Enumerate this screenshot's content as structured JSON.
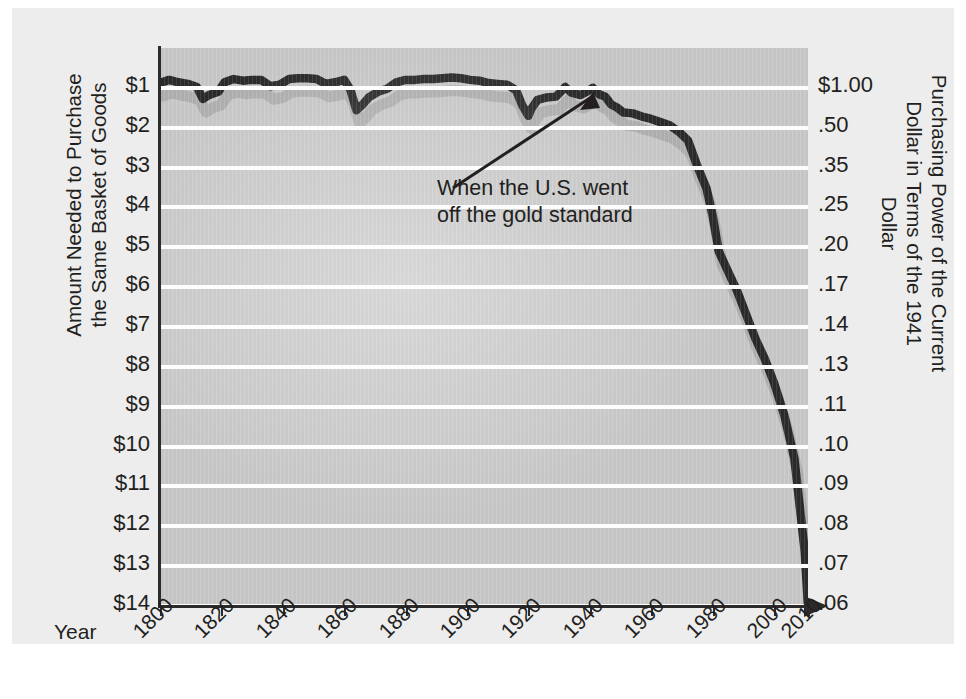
{
  "figure": {
    "background_color": "#ffffff",
    "panel_color": "#ededed",
    "plot_color": "#c9c9c9",
    "gridline_color": "#fdfdfd",
    "line_color": "#2b2b2b",
    "axis_color": "#2b2b2b"
  },
  "axes": {
    "x_axis_name": "Year",
    "left_title_line1": "Amount Needed to Purchase",
    "left_title_line2": "the Same Basket of Goods",
    "right_title_line1": "Purchasing Power of the Current",
    "right_title_line2": "Dollar in Terms of the 1941 Dollar"
  },
  "annotation": {
    "line1": "When the U.S. went",
    "line2": "off the gold standard",
    "target_year": 1941
  },
  "chart_data": {
    "type": "line",
    "title": "",
    "subtitle": "",
    "xlabel": "Year",
    "ylabel": "Amount Needed to Purchase the Same Basket of Goods",
    "ylabel_right": "Purchasing Power of the Current Dollar in Terms of the 1941 Dollar",
    "grid": true,
    "legend": "none",
    "xlim": [
      1800,
      2010
    ],
    "x_tick_labels": [
      "1800",
      "1820",
      "1840",
      "1860",
      "1880",
      "1900",
      "1920",
      "1940",
      "1960",
      "1980",
      "2000",
      "2010"
    ],
    "x_tick_values": [
      1800,
      1820,
      1840,
      1860,
      1880,
      1900,
      1920,
      1940,
      1960,
      1980,
      2000,
      2010
    ],
    "y_left_tick_labels": [
      "$1",
      "$2",
      "$3",
      "$4",
      "$5",
      "$6",
      "$7",
      "$8",
      "$9",
      "$10",
      "$11",
      "$12",
      "$13",
      "$14"
    ],
    "y_left_tick_values": [
      1,
      2,
      3,
      4,
      5,
      6,
      7,
      8,
      9,
      10,
      11,
      12,
      13,
      14
    ],
    "y_right_tick_labels": [
      "$1.00",
      ".50",
      ".35",
      ".25",
      ".20",
      ".17",
      ".14",
      ".13",
      ".11",
      ".10",
      ".09",
      ".08",
      ".07",
      ".06"
    ],
    "y_right_tick_values": [
      1.0,
      0.5,
      0.35,
      0.25,
      0.2,
      0.17,
      0.14,
      0.13,
      0.11,
      0.1,
      0.09,
      0.08,
      0.07,
      0.06
    ],
    "y_axis_note": "Left scale is dollars needed (1 to 14), inverted so larger dollars are lower. Right scale is the reciprocal purchasing power.",
    "series": [
      {
        "name": "Dollars needed to purchase the same basket of goods",
        "units": "dollars",
        "x": [
          1800,
          1803,
          1806,
          1809,
          1812,
          1814,
          1816,
          1819,
          1821,
          1824,
          1827,
          1830,
          1833,
          1836,
          1839,
          1842,
          1845,
          1848,
          1851,
          1854,
          1857,
          1860,
          1862,
          1864,
          1866,
          1868,
          1871,
          1874,
          1877,
          1880,
          1883,
          1886,
          1889,
          1892,
          1895,
          1898,
          1901,
          1904,
          1907,
          1910,
          1913,
          1916,
          1918,
          1920,
          1921,
          1923,
          1926,
          1929,
          1932,
          1934,
          1937,
          1939,
          1941,
          1943,
          1945,
          1947,
          1949,
          1951,
          1954,
          1957,
          1960,
          1963,
          1966,
          1969,
          1972,
          1975,
          1978,
          1980,
          1982,
          1985,
          1988,
          1991,
          1994,
          1997,
          2000,
          2003,
          2006,
          2009,
          2010
        ],
        "y": [
          0.88,
          0.8,
          0.86,
          0.9,
          0.98,
          1.28,
          1.18,
          1.1,
          0.86,
          0.78,
          0.82,
          0.8,
          0.8,
          0.96,
          0.92,
          0.78,
          0.76,
          0.76,
          0.78,
          0.9,
          0.86,
          0.8,
          1.04,
          1.56,
          1.42,
          1.24,
          1.1,
          1.02,
          0.86,
          0.8,
          0.8,
          0.78,
          0.78,
          0.76,
          0.74,
          0.76,
          0.8,
          0.82,
          0.88,
          0.9,
          0.92,
          1.06,
          1.44,
          1.7,
          1.52,
          1.3,
          1.24,
          1.22,
          0.98,
          1.12,
          1.18,
          1.1,
          1.0,
          1.16,
          1.22,
          1.42,
          1.5,
          1.62,
          1.64,
          1.72,
          1.78,
          1.86,
          1.94,
          2.1,
          2.32,
          2.96,
          3.52,
          4.2,
          5.1,
          5.6,
          6.1,
          6.7,
          7.3,
          7.8,
          8.4,
          9.2,
          10.3,
          12.6,
          14.0
        ],
        "comment": "Approximate readings traced from the plotted curve; values are dollars needed (inverted axis)."
      }
    ],
    "key_points": [
      {
        "year": 1800,
        "dollars": 0.88,
        "purchasing_power": 1.14
      },
      {
        "year": 1814,
        "dollars": 1.28,
        "purchasing_power": 0.78
      },
      {
        "year": 1864,
        "dollars": 1.56,
        "purchasing_power": 0.64
      },
      {
        "year": 1920,
        "dollars": 1.7,
        "purchasing_power": 0.59
      },
      {
        "year": 1941,
        "dollars": 1.0,
        "purchasing_power": 1.0
      },
      {
        "year": 1960,
        "dollars": 1.78,
        "purchasing_power": 0.56
      },
      {
        "year": 1980,
        "dollars": 4.2,
        "purchasing_power": 0.24
      },
      {
        "year": 2000,
        "dollars": 8.4,
        "purchasing_power": 0.12
      },
      {
        "year": 2010,
        "dollars": 14.0,
        "purchasing_power": 0.06
      }
    ]
  }
}
